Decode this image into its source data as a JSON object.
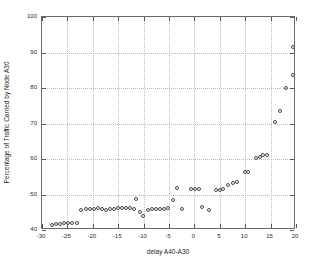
{
  "chart_data": {
    "type": "scatter",
    "title": "",
    "xlabel": "delay A40-A30",
    "ylabel": "Percentage of Traffic Carried by Node A30",
    "xlim": [
      -30,
      20
    ],
    "ylim": [
      40,
      100
    ],
    "xticks": [
      -30,
      -25,
      -20,
      -15,
      -10,
      -5,
      0,
      5,
      10,
      15,
      20
    ],
    "xticklabels": [
      "-30",
      "-25",
      "-20",
      "-15",
      "-10",
      "-5",
      "0",
      "5",
      "10",
      "15",
      "20"
    ],
    "yticks": [
      40,
      50,
      60,
      70,
      80,
      90,
      100
    ],
    "yticklabels": [
      "40",
      "50",
      "60",
      "70",
      "80",
      "90",
      "100"
    ],
    "grid": true,
    "legend": null,
    "marker": "open-circle",
    "marker_color": "#4a4a4a",
    "axis_color": "#6b6b6b",
    "grid_color": "#bdbdbd",
    "background": "#ffffff",
    "points": [
      {
        "x": -28.0,
        "y": 41.4
      },
      {
        "x": -27.2,
        "y": 41.6
      },
      {
        "x": -26.4,
        "y": 41.8
      },
      {
        "x": -25.6,
        "y": 41.9
      },
      {
        "x": -24.8,
        "y": 42.0
      },
      {
        "x": -24.0,
        "y": 42.1
      },
      {
        "x": -23.2,
        "y": 42.1
      },
      {
        "x": -22.3,
        "y": 45.7
      },
      {
        "x": -21.4,
        "y": 45.8
      },
      {
        "x": -20.6,
        "y": 45.9
      },
      {
        "x": -19.8,
        "y": 46.0
      },
      {
        "x": -19.0,
        "y": 46.1
      },
      {
        "x": -18.2,
        "y": 45.8
      },
      {
        "x": -17.4,
        "y": 45.6
      },
      {
        "x": -16.6,
        "y": 45.9
      },
      {
        "x": -15.8,
        "y": 46.0
      },
      {
        "x": -15.0,
        "y": 46.1
      },
      {
        "x": -14.2,
        "y": 46.1
      },
      {
        "x": -13.4,
        "y": 46.2
      },
      {
        "x": -12.6,
        "y": 46.3
      },
      {
        "x": -11.8,
        "y": 45.9
      },
      {
        "x": -11.4,
        "y": 48.6
      },
      {
        "x": -10.8,
        "y": 45.2
      },
      {
        "x": -10.1,
        "y": 44.0
      },
      {
        "x": -9.1,
        "y": 45.6
      },
      {
        "x": -8.3,
        "y": 46.0
      },
      {
        "x": -7.5,
        "y": 46.0
      },
      {
        "x": -6.7,
        "y": 46.0
      },
      {
        "x": -5.9,
        "y": 46.0
      },
      {
        "x": -5.1,
        "y": 46.2
      },
      {
        "x": -4.3,
        "y": 48.4
      },
      {
        "x": -3.5,
        "y": 51.7
      },
      {
        "x": -2.4,
        "y": 45.8
      },
      {
        "x": -0.7,
        "y": 51.6
      },
      {
        "x": 0.1,
        "y": 51.6
      },
      {
        "x": 0.9,
        "y": 51.6
      },
      {
        "x": 1.5,
        "y": 46.6
      },
      {
        "x": 2.8,
        "y": 45.7
      },
      {
        "x": 4.3,
        "y": 51.4
      },
      {
        "x": 5.0,
        "y": 51.4
      },
      {
        "x": 5.7,
        "y": 51.5
      },
      {
        "x": 6.7,
        "y": 52.6
      },
      {
        "x": 7.5,
        "y": 53.2
      },
      {
        "x": 8.3,
        "y": 53.6
      },
      {
        "x": 9.9,
        "y": 56.4
      },
      {
        "x": 10.6,
        "y": 56.4
      },
      {
        "x": 12.1,
        "y": 60.2
      },
      {
        "x": 12.9,
        "y": 60.5
      },
      {
        "x": 13.6,
        "y": 61.0
      },
      {
        "x": 14.3,
        "y": 61.1
      },
      {
        "x": 15.9,
        "y": 70.5
      },
      {
        "x": 16.8,
        "y": 73.4
      },
      {
        "x": 18.1,
        "y": 79.9
      },
      {
        "x": 19.4,
        "y": 83.8
      },
      {
        "x": 19.4,
        "y": 91.6
      }
    ]
  }
}
